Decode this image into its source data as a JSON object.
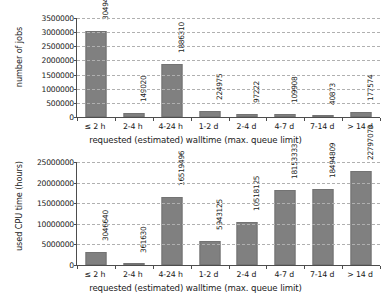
{
  "chart_data": [
    {
      "type": "bar",
      "id": "jobs-chart",
      "title": "",
      "xlabel": "requested (estimated) walltime (max. queue limit)",
      "ylabel": "number of jobs",
      "categories": [
        "≤ 2 h",
        "2-4 h",
        "4-24 h",
        "1-2 d",
        "2-4 d",
        "4-7 d",
        "7-14 d",
        "> 14 d"
      ],
      "values": [
        3049474,
        149020,
        1886310,
        224975,
        97222,
        109908,
        40873,
        177574
      ],
      "data_labels": [
        "3049474",
        "149020",
        "1886310",
        "224975",
        "97222",
        "109908",
        "40873",
        "177574"
      ],
      "ylim": [
        0,
        3500000
      ],
      "ytick_values": [
        0,
        500000,
        1000000,
        1500000,
        2000000,
        2500000,
        3000000,
        3500000
      ],
      "ytick_labels": [
        "0",
        "500000",
        "1000000",
        "1500000",
        "2000000",
        "2500000",
        "3000000",
        "3500000"
      ],
      "grid": true,
      "legend": "none",
      "bar_color": "#808080"
    },
    {
      "type": "bar",
      "id": "cpu-chart",
      "title": "",
      "xlabel": "requested (estimated) walltime (max. queue limit)",
      "ylabel": "used CPU time (hours)",
      "categories": [
        "≤ 2 h",
        "2-4 h",
        "4-24 h",
        "1-2 d",
        "2-4 d",
        "4-7 d",
        "7-14 d",
        "> 14 d"
      ],
      "values": [
        3046640,
        361630,
        16519496,
        5943125,
        10518125,
        18153333,
        18494809,
        22797073
      ],
      "data_labels": [
        "3046640",
        "361630",
        "16519496",
        "5943125",
        "10518125",
        "18153333",
        "18494809",
        "22797073"
      ],
      "ylim": [
        0,
        25000000
      ],
      "ytick_values": [
        0,
        5000000,
        10000000,
        15000000,
        20000000,
        25000000
      ],
      "ytick_labels": [
        "0",
        "5000000",
        "10000000",
        "15000000",
        "20000000",
        "25000000"
      ],
      "grid": true,
      "legend": "none",
      "bar_color": "#808080"
    }
  ]
}
